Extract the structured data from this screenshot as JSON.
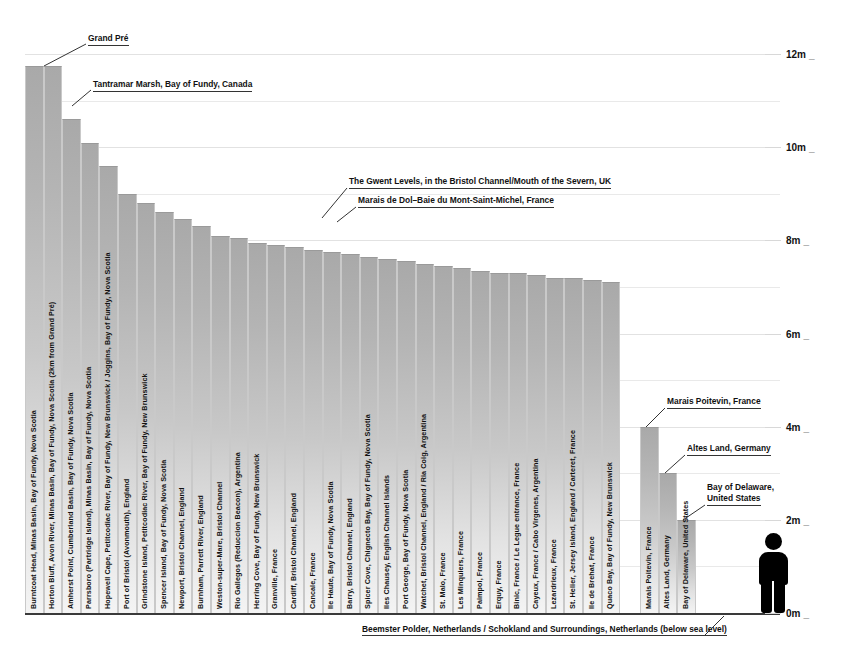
{
  "chart_data": {
    "type": "bar",
    "title": "",
    "xlabel": "",
    "ylabel": "",
    "ylim": [
      0,
      12
    ],
    "grid": true,
    "legend": "none",
    "unit": "m",
    "y_ticks": [
      "0m",
      "2m",
      "4m",
      "6m",
      "8m",
      "10m",
      "12m"
    ],
    "y_tick_values": [
      0,
      2,
      4,
      6,
      8,
      10,
      12
    ],
    "categories": [
      "Burntcoat Head, Minas Basin, Bay of Fundy, Nova Scotia",
      "Horton Bluff, Avon River, Minas Basin, Bay of Fundy, Nova Scotia (2km from Grand Pré)",
      "Amherst Point, Cumberland Basin, Bay of Fundy, Nova Scotia",
      "Parrsboro (Partridge Island), Minas Basin, Bay of Fundy, Nova Scotia",
      "Hopewell Cape, Petitcodiac River, Bay of Fundy, New Brunswick / Joggins, Bay of Fundy, Nova Scotia",
      "Port of Bristol (Avonmouth), England",
      "Grindstone Island, Petitcodiac River, Bay of Fundy, New Brunswick",
      "Spencer Island, Bay of Fundy, Nova Scotia",
      "Newport, Bristol Channel, England",
      "Burnham, Parrett River, England",
      "Weston-super-Mare, Bristol Channel",
      "Rio Gallegos (Reduccion Beacon), Argentina",
      "Herring Cove, Bay of Fundy, New Brunswick",
      "Granville, France",
      "Cardiff, Bristol Channel, England",
      "Cancale, France",
      "Ile Haute, Bay of Fundy, Nova Scotia",
      "Barry, Bristol Channel, England",
      "Spicer Cove, Chignecto Bay, Bay of Fundy, Nova Scotia",
      "Iles Chausey, English Channel Islands",
      "Port George, Bay of Fundy, Nova Scotia",
      "Watchet, Bristol Channel, England / Ria Coig, Argentina",
      "St. Malo, France",
      "Les Minquiers, France",
      "Paimpol, France",
      "Erquy, France",
      "Binic, France / Le Legue entrance, France",
      "Cayeux, France / Cabo Virgenes, Argentina",
      "Lezardrieux, France",
      "St. Helier, Jersey Island, England / Carteret, France",
      "Ile de Brehat, France",
      "Quaco Bay, Bay of Fundy, New Brunswick",
      "Marais Poitevin, France",
      "Altes Land, Germany",
      "Bay of Delaware, United States"
    ],
    "values": [
      11.75,
      11.75,
      10.6,
      10.1,
      9.6,
      9.0,
      8.8,
      8.6,
      8.45,
      8.3,
      8.1,
      8.05,
      7.95,
      7.9,
      7.85,
      7.8,
      7.75,
      7.7,
      7.65,
      7.6,
      7.55,
      7.5,
      7.45,
      7.4,
      7.35,
      7.3,
      7.3,
      7.25,
      7.2,
      7.2,
      7.15,
      7.1,
      4.0,
      3.0,
      2.0
    ]
  },
  "annotations": [
    {
      "id": "grand-pre",
      "text": "Grand Pré"
    },
    {
      "id": "tantramar",
      "text": "Tantramar Marsh, Bay of Fundy, Canada"
    },
    {
      "id": "gwent",
      "text": "The Gwent Levels, in the Bristol Channel/Mouth of the Severn, UK"
    },
    {
      "id": "dol",
      "text": "Marais de Dol–Baie du Mont-Saint-Michel, France"
    },
    {
      "id": "poitevin",
      "text": "Marais Poitevin, France"
    },
    {
      "id": "altes",
      "text": "Altes Land, Germany"
    },
    {
      "id": "delaware-1",
      "text": "Bay of Delaware,"
    },
    {
      "id": "delaware-2",
      "text": "United States"
    }
  ],
  "footnote": {
    "text": "Beemster Polder, Netherlands / Schokland and Surroundings, Netherlands (below sea level)"
  },
  "figure": {
    "label": "human-scale-figure"
  },
  "colors": {
    "bar_top": "#a9a9a9",
    "bar_bottom": "#f4f4f4",
    "grid": "#e9e9e9",
    "axis": "#3a3a3a",
    "text": "#111111",
    "figure": "#000000"
  }
}
